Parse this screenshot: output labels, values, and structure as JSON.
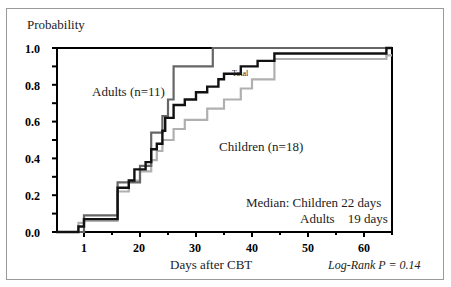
{
  "chart_data": {
    "type": "line",
    "subtype": "step (Kaplan-Meier cumulative incidence)",
    "ylabel": "Probability",
    "xlabel": "Days after CBT",
    "y_ticks": [
      "0.0",
      "0.2",
      "0.4",
      "0.6",
      "0.8",
      "1.0"
    ],
    "x_ticks": [
      "1",
      "20",
      "30",
      "40",
      "50",
      "60"
    ],
    "ylim": [
      0,
      1.0
    ],
    "xlim": [
      5,
      65
    ],
    "grid": false,
    "series": [
      {
        "name": "Adults (n=11)",
        "color": "#666666",
        "points": [
          [
            5,
            0
          ],
          [
            10,
            0
          ],
          [
            10,
            0.09
          ],
          [
            16,
            0.09
          ],
          [
            16,
            0.27
          ],
          [
            20,
            0.27
          ],
          [
            20,
            0.36
          ],
          [
            22,
            0.36
          ],
          [
            22,
            0.54
          ],
          [
            24,
            0.54
          ],
          [
            24,
            0.63
          ],
          [
            25,
            0.63
          ],
          [
            25,
            0.72
          ],
          [
            26,
            0.72
          ],
          [
            26,
            0.9
          ],
          [
            33,
            0.9
          ],
          [
            33,
            1.0
          ],
          [
            65,
            1.0
          ]
        ]
      },
      {
        "name": "Children (n=18)",
        "color": "#b0b0b0",
        "points": [
          [
            5,
            0
          ],
          [
            9,
            0
          ],
          [
            9,
            0.05
          ],
          [
            10,
            0.05
          ],
          [
            10,
            0.06
          ],
          [
            16,
            0.06
          ],
          [
            16,
            0.22
          ],
          [
            18,
            0.22
          ],
          [
            18,
            0.28
          ],
          [
            20,
            0.28
          ],
          [
            20,
            0.33
          ],
          [
            22,
            0.33
          ],
          [
            22,
            0.39
          ],
          [
            23,
            0.39
          ],
          [
            23,
            0.44
          ],
          [
            24,
            0.44
          ],
          [
            24,
            0.5
          ],
          [
            26,
            0.5
          ],
          [
            26,
            0.56
          ],
          [
            28,
            0.56
          ],
          [
            28,
            0.61
          ],
          [
            32,
            0.61
          ],
          [
            32,
            0.67
          ],
          [
            35,
            0.67
          ],
          [
            35,
            0.72
          ],
          [
            38,
            0.72
          ],
          [
            38,
            0.78
          ],
          [
            40,
            0.78
          ],
          [
            40,
            0.83
          ],
          [
            44,
            0.83
          ],
          [
            44,
            0.94
          ],
          [
            64,
            0.94
          ],
          [
            64,
            0.96
          ],
          [
            65,
            0.96
          ]
        ]
      },
      {
        "name": "Total",
        "color": "#111111",
        "points": [
          [
            5,
            0
          ],
          [
            9,
            0
          ],
          [
            9,
            0.03
          ],
          [
            10,
            0.03
          ],
          [
            10,
            0.07
          ],
          [
            16,
            0.07
          ],
          [
            16,
            0.24
          ],
          [
            18,
            0.24
          ],
          [
            18,
            0.28
          ],
          [
            19,
            0.28
          ],
          [
            19,
            0.34
          ],
          [
            21,
            0.34
          ],
          [
            21,
            0.38
          ],
          [
            22,
            0.38
          ],
          [
            22,
            0.45
          ],
          [
            23,
            0.45
          ],
          [
            23,
            0.48
          ],
          [
            24,
            0.48
          ],
          [
            24,
            0.55
          ],
          [
            24.5,
            0.55
          ],
          [
            24.5,
            0.62
          ],
          [
            26,
            0.62
          ],
          [
            26,
            0.69
          ],
          [
            28,
            0.69
          ],
          [
            28,
            0.72
          ],
          [
            30,
            0.72
          ],
          [
            30,
            0.76
          ],
          [
            32,
            0.76
          ],
          [
            32,
            0.79
          ],
          [
            34,
            0.79
          ],
          [
            34,
            0.83
          ],
          [
            35,
            0.83
          ],
          [
            35,
            0.86
          ],
          [
            38,
            0.86
          ],
          [
            38,
            0.9
          ],
          [
            41,
            0.9
          ],
          [
            41,
            0.93
          ],
          [
            44,
            0.93
          ],
          [
            44,
            0.97
          ],
          [
            64,
            0.97
          ],
          [
            64,
            1.0
          ],
          [
            65,
            1.0
          ]
        ]
      }
    ],
    "annotations": [
      "Adults (n=11)",
      "Children (n=18)",
      "Total",
      "Median: Children 22 days",
      "Adults 19 days",
      "Log-Rank P = 0.14"
    ]
  },
  "labels": {
    "ylabel": "Probability",
    "xlabel": "Days after CBT",
    "adults": "Adults (n=11)",
    "children": "Children (n=18)",
    "total": "Total",
    "median_line1": "Median: Children 22 days",
    "median_line2": "Adults    19 days",
    "logrank": "Log-Rank P = 0.14",
    "y_ticks": [
      "0.0",
      "0.2",
      "0.4",
      "0.6",
      "0.8",
      "1.0"
    ],
    "x_ticks": [
      "1",
      "20",
      "30",
      "40",
      "50",
      "60"
    ]
  }
}
